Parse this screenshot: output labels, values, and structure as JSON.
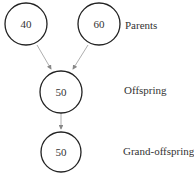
{
  "nodes": [
    {
      "id": "parent-1",
      "value": "40"
    },
    {
      "id": "parent-2",
      "value": "60"
    },
    {
      "id": "offspring",
      "value": "50"
    },
    {
      "id": "grand-offspring",
      "value": "50"
    }
  ],
  "labels": {
    "parents": "Parents",
    "offspring": "Offspring",
    "grand_offspring": "Grand-offspring"
  },
  "edges": [
    {
      "from": "parent-1",
      "to": "offspring"
    },
    {
      "from": "parent-2",
      "to": "offspring"
    },
    {
      "from": "offspring",
      "to": "grand-offspring"
    }
  ],
  "colors": {
    "stroke": "#222222",
    "arrow": "#888888",
    "text": "#333333"
  }
}
